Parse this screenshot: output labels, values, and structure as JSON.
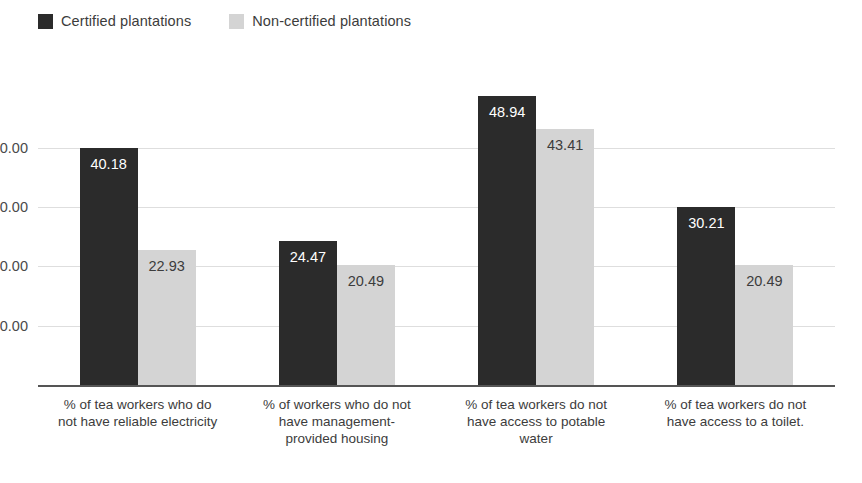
{
  "chart_data": {
    "type": "bar",
    "title": "",
    "subtitle": "",
    "xlabel": "",
    "ylabel": "",
    "grid": true,
    "legend_position": "top-left",
    "ylim": [
      0,
      53.3
    ],
    "yticks": [
      10,
      20,
      30,
      40
    ],
    "ytick_labels": [
      "10.00",
      "20.00",
      "30.00",
      "40.00"
    ],
    "categories": [
      "% of tea workers who do not have reliable electricity",
      "% of workers who do not have management-provided housing",
      "% of tea workers do not have access to potable water",
      "% of tea workers do not have access to a toilet."
    ],
    "series": [
      {
        "name": "Certified plantations",
        "color": "#2b2b2b",
        "values": [
          40.18,
          24.47,
          48.94,
          30.21
        ],
        "labels": [
          "40.18",
          "24.47",
          "48.94",
          "30.21"
        ]
      },
      {
        "name": "Non-certified plantations",
        "color": "#d4d4d4",
        "values": [
          22.93,
          20.49,
          43.41,
          20.49
        ],
        "labels": [
          "22.93",
          "20.49",
          "43.41",
          "20.49"
        ]
      }
    ]
  },
  "axis": {
    "line_color": "#555555",
    "gridline_color": "#dedede"
  },
  "background_color": "#ffffff"
}
